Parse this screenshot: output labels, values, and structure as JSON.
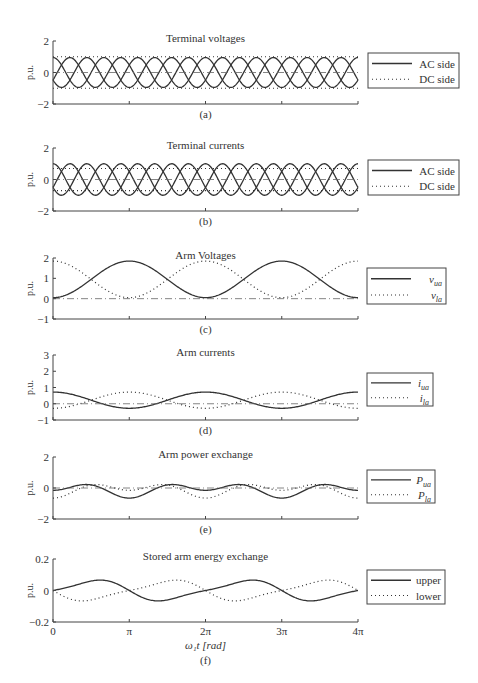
{
  "figure": {
    "xlabel": "ω₁t [rad]",
    "x_ticks": [
      "0",
      "π",
      "2π",
      "3π",
      "4π"
    ],
    "ylabel": "p.u.",
    "colors": {
      "line": "#333333",
      "axis": "#444444",
      "text": "#333333"
    }
  },
  "chart_data": [
    {
      "id": "a",
      "type": "line",
      "title": "Terminal voltages",
      "sublabel": "(a)",
      "ylim": [
        -2,
        2
      ],
      "yticks": [
        "2",
        "0",
        "−2"
      ],
      "ytick_values": [
        2,
        0,
        -2
      ],
      "xlim": [
        0,
        12.566
      ],
      "px": {
        "top": 41,
        "bottom": 104
      },
      "legend": [
        {
          "label": "AC side",
          "style": "solid"
        },
        {
          "label": "DC side",
          "style": "dotted"
        }
      ],
      "legend_box": {
        "x": 368,
        "y": 53,
        "w": 91,
        "h": 35
      },
      "series": [
        {
          "name": "AC side",
          "style": "solid",
          "kind": "three_phase",
          "amplitude": 0.95,
          "freq": 3,
          "phases_deg": [
            0,
            120,
            240
          ]
        },
        {
          "name": "DC side",
          "style": "dotted",
          "kind": "constant",
          "values": [
            1.0,
            -1.0
          ]
        },
        {
          "name": "reference",
          "style": "dashdot",
          "kind": "constant",
          "values": [
            0
          ]
        }
      ]
    },
    {
      "id": "b",
      "type": "line",
      "title": "Terminal currents",
      "sublabel": "(b)",
      "ylim": [
        -2,
        2
      ],
      "yticks": [
        "2",
        "0",
        "−2"
      ],
      "ytick_values": [
        2,
        0,
        -2
      ],
      "xlim": [
        0,
        12.566
      ],
      "px": {
        "top": 148,
        "bottom": 211
      },
      "legend": [
        {
          "label": "AC side",
          "style": "solid"
        },
        {
          "label": "DC side",
          "style": "dotted"
        }
      ],
      "legend_box": {
        "x": 368,
        "y": 160,
        "w": 91,
        "h": 35
      },
      "series": [
        {
          "name": "AC side",
          "style": "solid",
          "kind": "three_phase",
          "amplitude": 1.0,
          "freq": 3,
          "phases_deg": [
            0,
            120,
            240
          ]
        },
        {
          "name": "DC side",
          "style": "dotted",
          "kind": "constant",
          "values": [
            0.7,
            -0.7
          ]
        },
        {
          "name": "reference",
          "style": "dashdot",
          "kind": "constant",
          "values": [
            0
          ]
        }
      ]
    },
    {
      "id": "c",
      "type": "line",
      "title": "Arm Voltages",
      "sublabel": "(c)",
      "ylim": [
        -1,
        2
      ],
      "yticks": [
        "2",
        "1",
        "0",
        "−1"
      ],
      "ytick_values": [
        2,
        1,
        0,
        -1
      ],
      "xlim": [
        0,
        12.566
      ],
      "px": {
        "top": 258,
        "bottom": 319
      },
      "legend": [
        {
          "label": "v",
          "sub": "ua",
          "style": "solid"
        },
        {
          "label": "v",
          "sub": "la",
          "style": "dotted"
        }
      ],
      "legend_box": {
        "x": 367,
        "y": 268,
        "w": 79,
        "h": 36
      },
      "series": [
        {
          "name": "v_ua",
          "style": "solid",
          "kind": "cos",
          "offset": 0.95,
          "amplitude": -0.9,
          "freq": 1,
          "phase_deg": 0
        },
        {
          "name": "v_la",
          "style": "dotted",
          "kind": "cos",
          "offset": 0.95,
          "amplitude": 0.9,
          "freq": 1,
          "phase_deg": 0
        },
        {
          "name": "reference",
          "style": "dashdot",
          "kind": "constant",
          "values": [
            0
          ]
        }
      ]
    },
    {
      "id": "d",
      "type": "line",
      "title": "Arm currents",
      "sublabel": "(d)",
      "ylim": [
        -1,
        3
      ],
      "yticks": [
        "3",
        "2",
        "1",
        "0",
        "−1"
      ],
      "ytick_values": [
        3,
        2,
        1,
        0,
        -1
      ],
      "xlim": [
        0,
        12.566
      ],
      "px": {
        "top": 355,
        "bottom": 420
      },
      "legend": [
        {
          "label": "i",
          "sub": "ua",
          "style": "solid"
        },
        {
          "label": "i",
          "sub": "la",
          "style": "dotted"
        }
      ],
      "legend_box": {
        "x": 367,
        "y": 373,
        "w": 66,
        "h": 33
      },
      "series": [
        {
          "name": "i_ua",
          "style": "solid",
          "kind": "cos",
          "offset": 0.22,
          "amplitude": 0.5,
          "freq": 1,
          "phase_deg": 0
        },
        {
          "name": "i_la",
          "style": "dotted",
          "kind": "cos",
          "offset": 0.22,
          "amplitude": -0.5,
          "freq": 1,
          "phase_deg": 0
        },
        {
          "name": "reference",
          "style": "dashdot",
          "kind": "constant",
          "values": [
            0
          ]
        }
      ]
    },
    {
      "id": "e",
      "type": "line",
      "title": "Arm power exchange",
      "sublabel": "(e)",
      "ylim": [
        -2,
        2
      ],
      "yticks": [
        "2",
        "0",
        "−2"
      ],
      "ytick_values": [
        2,
        0,
        -2
      ],
      "xlim": [
        0,
        12.566
      ],
      "px": {
        "top": 457,
        "bottom": 519
      },
      "legend": [
        {
          "label": "P",
          "sub": "ua",
          "style": "solid"
        },
        {
          "label": "P",
          "sub": "la",
          "style": "dotted"
        }
      ],
      "legend_box": {
        "x": 367,
        "y": 470,
        "w": 68,
        "h": 33
      },
      "series": [
        {
          "name": "P_ua",
          "style": "solid",
          "kind": "harm",
          "terms": [
            [
              0,
              -0.1
            ],
            [
              1,
              0.25,
              0
            ],
            [
              2,
              -0.3,
              0
            ]
          ]
        },
        {
          "name": "P_la",
          "style": "dotted",
          "kind": "harm",
          "terms": [
            [
              0,
              -0.1
            ],
            [
              1,
              -0.25,
              0
            ],
            [
              2,
              -0.3,
              0
            ]
          ]
        },
        {
          "name": "reference",
          "style": "dashdot",
          "kind": "constant",
          "values": [
            0
          ]
        }
      ]
    },
    {
      "id": "f",
      "type": "line",
      "title": "Stored arm energy exchange",
      "sublabel": "(f)",
      "ylim": [
        -0.2,
        0.2
      ],
      "yticks": [
        "0.2",
        "0",
        "−0.2"
      ],
      "ytick_values": [
        0.2,
        0,
        -0.2
      ],
      "xlim": [
        0,
        12.566
      ],
      "px": {
        "top": 559,
        "bottom": 622
      },
      "legend": [
        {
          "label": "upper",
          "style": "solid"
        },
        {
          "label": "lower",
          "style": "dotted"
        }
      ],
      "legend_box": {
        "x": 367,
        "y": 570,
        "w": 78,
        "h": 34
      },
      "show_xticklabels": true,
      "series": [
        {
          "name": "upper",
          "style": "solid",
          "kind": "harm",
          "terms": [
            [
              1,
              0.06,
              -90
            ],
            [
              2,
              0.015,
              90
            ]
          ]
        },
        {
          "name": "lower",
          "style": "dotted",
          "kind": "harm",
          "terms": [
            [
              1,
              -0.06,
              -90
            ],
            [
              2,
              0.015,
              90
            ]
          ]
        }
      ]
    }
  ]
}
